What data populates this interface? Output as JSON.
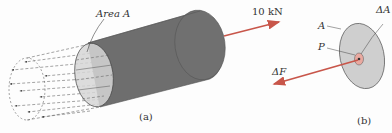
{
  "figure": {
    "panel_a": {
      "caption": "(a)",
      "area_label": "Area A",
      "force_label": "10 kN"
    },
    "panel_b": {
      "caption": "(b)",
      "label_A": "A",
      "label_dA": "ΔA",
      "label_P": "P",
      "label_dF": "ΔF"
    },
    "colors": {
      "cylinder_body": "#6e6e6e",
      "end_face": "#d6d6d6",
      "force_arrow": "#c8564a",
      "disk": "#cfcfcf",
      "point_area": "#e9a9a0"
    }
  }
}
